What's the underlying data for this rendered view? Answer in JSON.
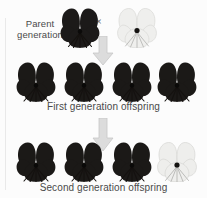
{
  "figure": {
    "background_color": "#fcfcfc",
    "text_color": "#4a4a4a"
  },
  "labels": {
    "parent": "Parent\ngeneration",
    "first_generation": "First generation offspring",
    "second_generation": "Second generation offspring",
    "cross_symbol": "×"
  },
  "colors": {
    "dark_flower": "#1c1a19",
    "white_flower": "#eeeeec",
    "white_flower_outline": "#cfcfcd",
    "arrow_fill": "#d9d9d9",
    "arrow_outline": "#c4c4c4",
    "page_rule": "#e9e9e9"
  },
  "generations": [
    {
      "name": "parent-generation",
      "label": "Parent generation",
      "flowers": [
        {
          "name": "parent-flower-dark",
          "color": "dark",
          "x": 58,
          "y": 6
        },
        {
          "name": "parent-flower-white",
          "color": "white",
          "x": 116,
          "y": 6
        }
      ]
    },
    {
      "name": "first-generation",
      "label": "First generation offspring",
      "flowers": [
        {
          "name": "f1-flower-1",
          "color": "dark",
          "x": 14,
          "y": 60
        },
        {
          "name": "f1-flower-2",
          "color": "dark",
          "x": 62,
          "y": 60
        },
        {
          "name": "f1-flower-3",
          "color": "dark",
          "x": 110,
          "y": 60
        },
        {
          "name": "f1-flower-4",
          "color": "dark",
          "x": 155,
          "y": 60
        }
      ]
    },
    {
      "name": "second-generation",
      "label": "Second generation offspring",
      "flowers": [
        {
          "name": "f2-flower-1",
          "color": "dark",
          "x": 14,
          "y": 140
        },
        {
          "name": "f2-flower-2",
          "color": "dark",
          "x": 62,
          "y": 140
        },
        {
          "name": "f2-flower-3",
          "color": "dark",
          "x": 110,
          "y": 140
        },
        {
          "name": "f2-flower-4",
          "color": "white",
          "x": 155,
          "y": 140
        }
      ]
    }
  ],
  "arrows": [
    {
      "name": "arrow-parent-to-f1",
      "direction": "down"
    },
    {
      "name": "arrow-f1-to-f2",
      "direction": "down"
    }
  ]
}
